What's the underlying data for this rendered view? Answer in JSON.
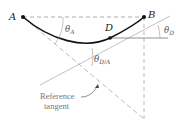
{
  "diagram": {
    "points": {
      "A": {
        "label": "A"
      },
      "B": {
        "label": "B"
      },
      "D": {
        "label": "D"
      }
    },
    "angles": {
      "theta_A": {
        "symbol": "θ",
        "sub": "A"
      },
      "theta_D": {
        "symbol": "θ",
        "sub": "D"
      },
      "theta_DA": {
        "symbol": "θ",
        "sub": "D/A"
      }
    },
    "annotation": {
      "line1": "Reference",
      "line2": "tangent"
    },
    "colors": {
      "curve": "#111111",
      "dashed": "#9a9a9a",
      "tangent": "#a0a0a0",
      "text": "#555555"
    }
  }
}
